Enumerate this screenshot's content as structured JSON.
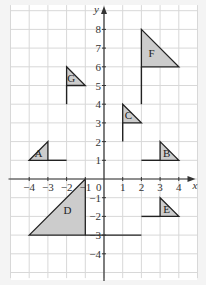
{
  "diagram": {
    "axes": {
      "x_label": "x",
      "y_label": "y",
      "origin_label": "0",
      "x_ticks": [
        {
          "v": -4,
          "label": "−4"
        },
        {
          "v": -3,
          "label": "−3"
        },
        {
          "v": -2,
          "label": "−2"
        },
        {
          "v": -1,
          "label": "−1"
        },
        {
          "v": 1,
          "label": "1"
        },
        {
          "v": 2,
          "label": "2"
        },
        {
          "v": 3,
          "label": "3"
        },
        {
          "v": 4,
          "label": "4"
        }
      ],
      "y_ticks": [
        {
          "v": 8,
          "label": "8"
        },
        {
          "v": 7,
          "label": "7"
        },
        {
          "v": 6,
          "label": "6"
        },
        {
          "v": 5,
          "label": "5"
        },
        {
          "v": 4,
          "label": "4"
        },
        {
          "v": 3,
          "label": "3"
        },
        {
          "v": 2,
          "label": "2"
        },
        {
          "v": 1,
          "label": "1"
        },
        {
          "v": -1,
          "label": "−1"
        },
        {
          "v": -2,
          "label": "−2"
        },
        {
          "v": -3,
          "label": "−3"
        },
        {
          "v": -4,
          "label": "−4"
        }
      ],
      "grid": {
        "x_min": -5,
        "x_max": 5,
        "y_min": -5.3,
        "y_max": 9.3
      }
    },
    "colors": {
      "background": "#f4f4f4",
      "grid_bg": "#ffffff",
      "grid_line": "#d8d8d8",
      "axis": "#333333",
      "shape_fill": "#cccccc",
      "shape_stroke": "#222222"
    },
    "flags": [
      {
        "name": "A",
        "tri": [
          [
            -4,
            1
          ],
          [
            -3,
            2
          ],
          [
            -3,
            1
          ]
        ],
        "pole": [
          [
            -3,
            1
          ],
          [
            -2,
            1
          ]
        ],
        "label_at": [
          -3.5,
          1.2
        ]
      },
      {
        "name": "B",
        "tri": [
          [
            3,
            2
          ],
          [
            4,
            1
          ],
          [
            3,
            1
          ]
        ],
        "pole": [
          [
            2,
            1
          ],
          [
            3,
            1
          ]
        ],
        "label_at": [
          3.35,
          1.2
        ]
      },
      {
        "name": "C",
        "tri": [
          [
            1,
            4
          ],
          [
            2,
            3
          ],
          [
            1,
            3
          ]
        ],
        "pole": [
          [
            1,
            2
          ],
          [
            1,
            3
          ]
        ],
        "label_at": [
          1.3,
          3.2
        ]
      },
      {
        "name": "D",
        "tri": [
          [
            -4,
            -3
          ],
          [
            -1,
            0
          ],
          [
            -1,
            -3
          ]
        ],
        "pole": [
          [
            -1,
            -3
          ],
          [
            2,
            -3
          ]
        ],
        "label_at": [
          -1.95,
          -1.85
        ]
      },
      {
        "name": "E",
        "tri": [
          [
            3,
            -1
          ],
          [
            4,
            -2
          ],
          [
            3,
            -2
          ]
        ],
        "pole": [
          [
            2,
            -2
          ],
          [
            3,
            -2
          ]
        ],
        "label_at": [
          3.35,
          -1.8
        ]
      },
      {
        "name": "F",
        "tri": [
          [
            2,
            8
          ],
          [
            4,
            6
          ],
          [
            2,
            6
          ]
        ],
        "pole": [
          [
            2,
            4
          ],
          [
            2,
            6
          ]
        ],
        "label_at": [
          2.55,
          6.5
        ]
      },
      {
        "name": "G",
        "tri": [
          [
            -2,
            6
          ],
          [
            -1,
            5
          ],
          [
            -2,
            5
          ]
        ],
        "pole": [
          [
            -2,
            4
          ],
          [
            -2,
            5
          ]
        ],
        "label_at": [
          -1.75,
          5.2
        ]
      }
    ]
  }
}
